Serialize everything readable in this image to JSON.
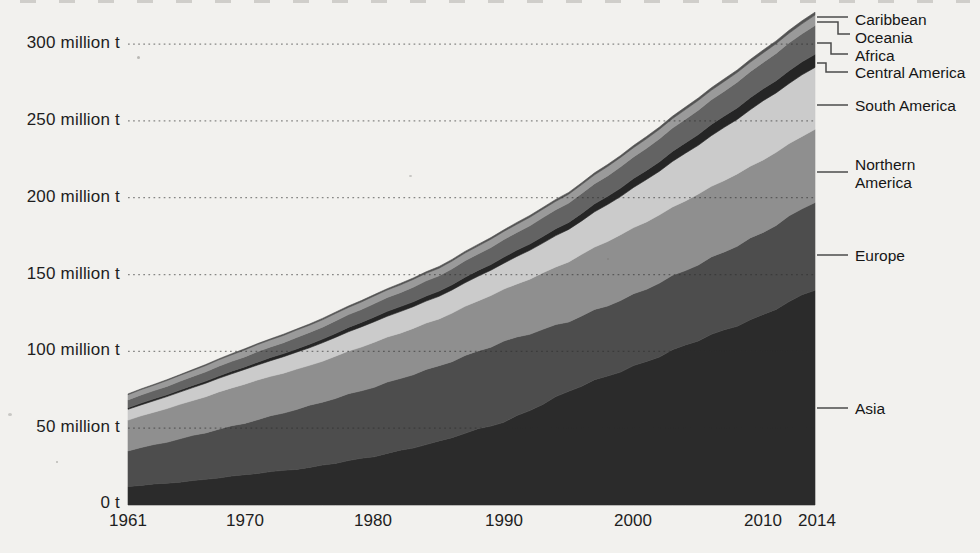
{
  "chart_data": {
    "type": "area",
    "stacked": true,
    "unit": "million t",
    "title": "",
    "xlabel": "",
    "ylabel": "",
    "x_range": [
      1961,
      2014
    ],
    "x_ticks": [
      1961,
      1970,
      1980,
      1990,
      2000,
      2010,
      2014
    ],
    "y_ticks": [
      {
        "value": 300,
        "label": "300 million t"
      },
      {
        "value": 250,
        "label": "250 million t"
      },
      {
        "value": 200,
        "label": "200 million t"
      },
      {
        "value": 150,
        "label": "150 million t"
      },
      {
        "value": 100,
        "label": "100 million t"
      },
      {
        "value": 50,
        "label": "50 million t"
      },
      {
        "value": 0,
        "label": "0 t"
      }
    ],
    "ylim": [
      0,
      330
    ],
    "grid": "dotted-horizontal",
    "legend_position": "right",
    "anchor_years": [
      1961,
      1965,
      1970,
      1975,
      1980,
      1985,
      1990,
      1995,
      2000,
      2005,
      2010,
      2014
    ],
    "series_bottom_to_top": [
      {
        "name": "Asia",
        "color": "#2b2b2b",
        "values": [
          12.0,
          15.0,
          19.6,
          24.5,
          31.5,
          41.5,
          54.0,
          74.0,
          90.5,
          107.0,
          124.0,
          140.0
        ]
      },
      {
        "name": "Europe",
        "color": "#4d4d4d",
        "values": [
          23.5,
          28.0,
          33.8,
          40.0,
          45.5,
          49.0,
          52.5,
          45.5,
          46.5,
          49.5,
          53.5,
          57.5
        ]
      },
      {
        "name": "Northern America",
        "color": "#8f8f8f",
        "values": [
          19.8,
          22.4,
          25.4,
          26.3,
          28.9,
          30.8,
          33.8,
          38.9,
          43.5,
          45.7,
          47.5,
          47.0
        ]
      },
      {
        "name": "South America",
        "color": "#cbcbcb",
        "values": [
          7.0,
          8.0,
          9.5,
          11.4,
          13.5,
          14.5,
          17.0,
          21.0,
          26.0,
          32.0,
          38.0,
          40.5
        ]
      },
      {
        "name": "Central America",
        "color": "#252525",
        "values": [
          1.1,
          1.3,
          1.7,
          2.3,
          3.1,
          3.4,
          3.9,
          4.6,
          5.8,
          7.0,
          7.9,
          8.6
        ]
      },
      {
        "name": "Africa",
        "color": "#636363",
        "values": [
          5.1,
          5.7,
          6.6,
          7.6,
          8.7,
          10.0,
          11.4,
          12.6,
          14.1,
          15.8,
          17.2,
          18.8
        ]
      },
      {
        "name": "Oceania",
        "color": "#9a9a9a",
        "values": [
          3.3,
          3.8,
          4.5,
          4.8,
          4.9,
          5.0,
          5.3,
          5.7,
          6.1,
          6.3,
          6.2,
          6.6
        ]
      },
      {
        "name": "Caribbean",
        "color": "#535353",
        "values": [
          0.5,
          0.55,
          0.65,
          0.78,
          0.9,
          1.0,
          1.1,
          1.15,
          1.4,
          1.6,
          1.8,
          1.95
        ]
      }
    ],
    "legend_items": [
      {
        "label": "Caribbean"
      },
      {
        "label": "Oceania"
      },
      {
        "label": "Africa"
      },
      {
        "label": "Central America"
      },
      {
        "label": "South America"
      },
      {
        "label": "Northern America"
      },
      {
        "label": "Europe"
      },
      {
        "label": "Asia"
      }
    ]
  }
}
